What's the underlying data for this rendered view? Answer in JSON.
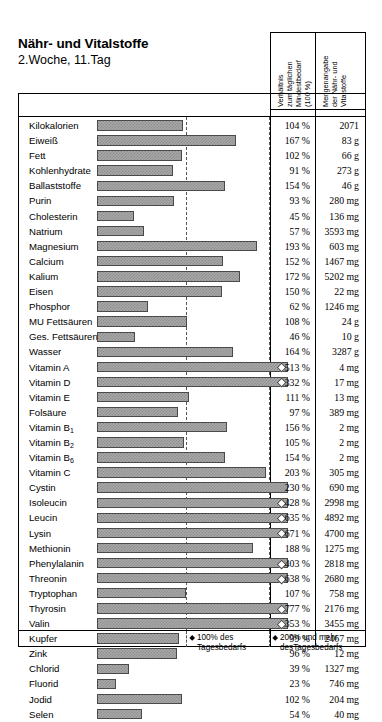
{
  "title": {
    "main": "Nähr- und Vitalstoffe",
    "sub": "2.Woche, 11.Tag"
  },
  "columns": {
    "ratio_header": "Verhältnis\nzum täglichen\nMindestbedarf\n(100 %)",
    "ratio_header_lines": [
      "Verhältnis",
      "zum täglichen",
      "Mindestbedarf",
      "(100 %)"
    ],
    "amount_header": "Mengenangabe\nder Nähr- und\nVitalstoffe",
    "amount_header_lines": [
      "Mengenangabe",
      "der Nähr- und",
      "Vitalstoffe"
    ]
  },
  "legend": {
    "marker_100": {
      "line1": "100% des",
      "line2": "Tagesbedarfs"
    },
    "marker_200": {
      "line1": "200% und mehr",
      "line2": "desTagesbedarfs"
    }
  },
  "axis": {
    "gridline_100_label": "100 %",
    "gridline_200_label": "200 %",
    "max_display_percent": 230
  },
  "chart_data": {
    "type": "bar",
    "xlabel": "Verhältnis zum täglichen Mindestbedarf (100 %)",
    "ylabel": "",
    "xlim": [
      0,
      230
    ],
    "grid": true,
    "gridlines": [
      100,
      200
    ],
    "legend_position": "bottom",
    "orientation": "horizontal",
    "categories": [
      "Kilokalorien",
      "Eiweiß",
      "Fett",
      "Kohlenhydrate",
      "Ballaststoffe",
      "Purin",
      "Cholesterin",
      "Natrium",
      "Magnesium",
      "Calcium",
      "Kalium",
      "Eisen",
      "Phosphor",
      "MU Fettsäuren",
      "Ges. Fettsäuren",
      "Wasser",
      "Vitamin A",
      "Vitamin D",
      "Vitamin E",
      "Folsäure",
      "Vitamin B1",
      "Vitamin B2",
      "Vitamin B6",
      "Vitamin C",
      "Cystin",
      "Isoleucin",
      "Leucin",
      "Lysin",
      "Methionin",
      "Phenylalanin",
      "Threonin",
      "Tryptophan",
      "Thyrosin",
      "Valin",
      "Kupfer",
      "Zink",
      "Chlorid",
      "Fluorid",
      "Jodid",
      "Selen"
    ],
    "values": [
      104,
      167,
      102,
      91,
      154,
      93,
      45,
      57,
      193,
      152,
      172,
      150,
      62,
      108,
      46,
      164,
      513,
      332,
      111,
      97,
      156,
      105,
      154,
      203,
      230,
      428,
      635,
      671,
      188,
      403,
      638,
      107,
      777,
      353,
      99,
      96,
      39,
      23,
      102,
      54
    ],
    "value_labels": [
      "104 %",
      "167 %",
      "102 %",
      "91 %",
      "154 %",
      "93 %",
      "45 %",
      "57 %",
      "193 %",
      "152 %",
      "172 %",
      "150 %",
      "62 %",
      "108 %",
      "46 %",
      "164 %",
      "513 %",
      "332 %",
      "111 %",
      "97 %",
      "156 %",
      "105 %",
      "154 %",
      "203 %",
      "230 %",
      "428 %",
      "635 %",
      "671 %",
      "188 %",
      "403 %",
      "638 %",
      "107 %",
      "777 %",
      "353 %",
      "99 %",
      "96 %",
      "39 %",
      "23 %",
      "102 %",
      "54 %"
    ],
    "amounts": [
      "2071",
      "83 g",
      "66 g",
      "273 g",
      "46 g",
      "280 mg",
      "136 mg",
      "3593 mg",
      "603 mg",
      "1467 mg",
      "5202 mg",
      "22 mg",
      "1246 mg",
      "24 g",
      "10 g",
      "3287 g",
      "4 mg",
      "17 mg",
      "13 mg",
      "389 mg",
      "2 mg",
      "2 mg",
      "2 mg",
      "305 mg",
      "690 mg",
      "2998 mg",
      "4892 mg",
      "4700 mg",
      "1275 mg",
      "2818 mg",
      "2680 mg",
      "758 mg",
      "2176 mg",
      "3455 mg",
      "2467 mg",
      "12 mg",
      "1327 mg",
      "746 mg",
      "204 mg",
      "40 mg"
    ]
  },
  "rows": [
    {
      "label": "Kilokalorien",
      "label_base": "Kilokalorien",
      "sub": "",
      "pct": "104 %",
      "value": 104,
      "amount": "2071"
    },
    {
      "label": "Eiweiß",
      "label_base": "Eiweiß",
      "sub": "",
      "pct": "167 %",
      "value": 167,
      "amount": "83 g"
    },
    {
      "label": "Fett",
      "label_base": "Fett",
      "sub": "",
      "pct": "102 %",
      "value": 102,
      "amount": "66 g"
    },
    {
      "label": "Kohlenhydrate",
      "label_base": "Kohlenhydrate",
      "sub": "",
      "pct": "91 %",
      "value": 91,
      "amount": "273 g"
    },
    {
      "label": "Ballaststoffe",
      "label_base": "Ballaststoffe",
      "sub": "",
      "pct": "154 %",
      "value": 154,
      "amount": "46 g"
    },
    {
      "label": "Purin",
      "label_base": "Purin",
      "sub": "",
      "pct": "93 %",
      "value": 93,
      "amount": "280 mg"
    },
    {
      "label": "Cholesterin",
      "label_base": "Cholesterin",
      "sub": "",
      "pct": "45 %",
      "value": 45,
      "amount": "136 mg"
    },
    {
      "label": "Natrium",
      "label_base": "Natrium",
      "sub": "",
      "pct": "57 %",
      "value": 57,
      "amount": "3593 mg"
    },
    {
      "label": "Magnesium",
      "label_base": "Magnesium",
      "sub": "",
      "pct": "193 %",
      "value": 193,
      "amount": "603 mg"
    },
    {
      "label": "Calcium",
      "label_base": "Calcium",
      "sub": "",
      "pct": "152 %",
      "value": 152,
      "amount": "1467 mg"
    },
    {
      "label": "Kalium",
      "label_base": "Kalium",
      "sub": "",
      "pct": "172 %",
      "value": 172,
      "amount": "5202 mg"
    },
    {
      "label": "Eisen",
      "label_base": "Eisen",
      "sub": "",
      "pct": "150 %",
      "value": 150,
      "amount": "22 mg"
    },
    {
      "label": "Phosphor",
      "label_base": "Phosphor",
      "sub": "",
      "pct": "62 %",
      "value": 62,
      "amount": "1246 mg"
    },
    {
      "label": "MU Fettsäuren",
      "label_base": "MU Fettsäuren",
      "sub": "",
      "pct": "108 %",
      "value": 108,
      "amount": "24 g"
    },
    {
      "label": "Ges. Fettsäuren",
      "label_base": "Ges. Fettsäuren",
      "sub": "",
      "pct": "46 %",
      "value": 46,
      "amount": "10 g"
    },
    {
      "label": "Wasser",
      "label_base": "Wasser",
      "sub": "",
      "pct": "164 %",
      "value": 164,
      "amount": "3287 g"
    },
    {
      "label": "Vitamin A",
      "label_base": "Vitamin A",
      "sub": "",
      "pct": "513 %",
      "value": 513,
      "amount": "4 mg"
    },
    {
      "label": "Vitamin D",
      "label_base": "Vitamin D",
      "sub": "",
      "pct": "332 %",
      "value": 332,
      "amount": "17 mg"
    },
    {
      "label": "Vitamin E",
      "label_base": "Vitamin E",
      "sub": "",
      "pct": "111 %",
      "value": 111,
      "amount": "13 mg"
    },
    {
      "label": "Folsäure",
      "label_base": "Folsäure",
      "sub": "",
      "pct": "97 %",
      "value": 97,
      "amount": "389 mg"
    },
    {
      "label": "Vitamin B1",
      "label_base": "Vitamin B",
      "sub": "1",
      "pct": "156 %",
      "value": 156,
      "amount": "2 mg"
    },
    {
      "label": "Vitamin B2",
      "label_base": "Vitamin B",
      "sub": "2",
      "pct": "105 %",
      "value": 105,
      "amount": "2 mg"
    },
    {
      "label": "Vitamin B6",
      "label_base": "Vitamin B",
      "sub": "6",
      "pct": "154 %",
      "value": 154,
      "amount": "2 mg"
    },
    {
      "label": "Vitamin C",
      "label_base": "Vitamin C",
      "sub": "",
      "pct": "203 %",
      "value": 203,
      "amount": "305 mg"
    },
    {
      "label": "Cystin",
      "label_base": "Cystin",
      "sub": "",
      "pct": "230 %",
      "value": 230,
      "amount": "690 mg"
    },
    {
      "label": "Isoleucin",
      "label_base": "Isoleucin",
      "sub": "",
      "pct": "428 %",
      "value": 428,
      "amount": "2998 mg"
    },
    {
      "label": "Leucin",
      "label_base": "Leucin",
      "sub": "",
      "pct": "635 %",
      "value": 635,
      "amount": "4892 mg"
    },
    {
      "label": "Lysin",
      "label_base": "Lysin",
      "sub": "",
      "pct": "671 %",
      "value": 671,
      "amount": "4700 mg"
    },
    {
      "label": "Methionin",
      "label_base": "Methionin",
      "sub": "",
      "pct": "188 %",
      "value": 188,
      "amount": "1275 mg"
    },
    {
      "label": "Phenylalanin",
      "label_base": "Phenylalanin",
      "sub": "",
      "pct": "403 %",
      "value": 403,
      "amount": "2818 mg"
    },
    {
      "label": "Threonin",
      "label_base": "Threonin",
      "sub": "",
      "pct": "638 %",
      "value": 638,
      "amount": "2680 mg"
    },
    {
      "label": "Tryptophan",
      "label_base": "Tryptophan",
      "sub": "",
      "pct": "107 %",
      "value": 107,
      "amount": "758 mg"
    },
    {
      "label": "Thyrosin",
      "label_base": "Thyrosin",
      "sub": "",
      "pct": "777 %",
      "value": 777,
      "amount": "2176 mg"
    },
    {
      "label": "Valin",
      "label_base": "Valin",
      "sub": "",
      "pct": "353 %",
      "value": 353,
      "amount": "3455 mg"
    },
    {
      "label": "Kupfer",
      "label_base": "Kupfer",
      "sub": "",
      "pct": "99 %",
      "value": 99,
      "amount": "2467 mg"
    },
    {
      "label": "Zink",
      "label_base": "Zink",
      "sub": "",
      "pct": "96 %",
      "value": 96,
      "amount": "12 mg"
    },
    {
      "label": "Chlorid",
      "label_base": "Chlorid",
      "sub": "",
      "pct": "39 %",
      "value": 39,
      "amount": "1327 mg"
    },
    {
      "label": "Fluorid",
      "label_base": "Fluorid",
      "sub": "",
      "pct": "23 %",
      "value": 23,
      "amount": "746 mg"
    },
    {
      "label": "Jodid",
      "label_base": "Jodid",
      "sub": "",
      "pct": "102 %",
      "value": 102,
      "amount": "204 mg"
    },
    {
      "label": "Selen",
      "label_base": "Selen",
      "sub": "",
      "pct": "54 %",
      "value": 54,
      "amount": "40 mg"
    }
  ]
}
